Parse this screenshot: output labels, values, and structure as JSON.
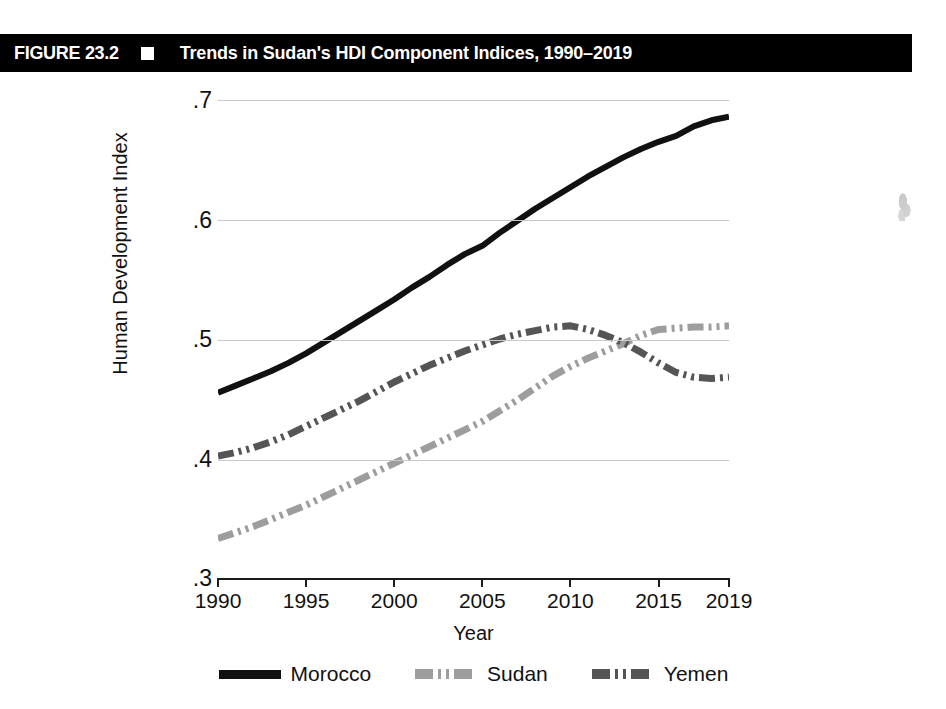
{
  "figure": {
    "number": "FIGURE 23.2",
    "marker": "black-square-bullet",
    "title": "Trends in Sudan's HDI Component Indices, 1990–2019"
  },
  "chart_data": {
    "type": "line",
    "title": "Trends in Sudan's HDI Component Indices, 1990–2019",
    "xlabel": "Year",
    "ylabel": "Human Development Index",
    "xlim": [
      1990,
      2019
    ],
    "ylim": [
      0.3,
      0.7
    ],
    "grid": true,
    "legend_position": "bottom",
    "xticks": [
      1990,
      1995,
      2000,
      2005,
      2010,
      2015,
      2019
    ],
    "xtick_labels": [
      "1990",
      "1995",
      "2000",
      "2005",
      "2010",
      "2015",
      "2019"
    ],
    "yticks": [
      0.3,
      0.4,
      0.5,
      0.6,
      0.7
    ],
    "ytick_labels": [
      ".3",
      ".4",
      ".5",
      ".6",
      ".7"
    ],
    "x": [
      1990,
      1991,
      1992,
      1993,
      1994,
      1995,
      1996,
      1997,
      1998,
      1999,
      2000,
      2001,
      2002,
      2003,
      2004,
      2005,
      2006,
      2007,
      2008,
      2009,
      2010,
      2011,
      2012,
      2013,
      2014,
      2015,
      2016,
      2017,
      2018,
      2019
    ],
    "series": [
      {
        "name": "Morocco",
        "color": "#111111",
        "style": "solid",
        "values": [
          0.455,
          0.461,
          0.467,
          0.473,
          0.48,
          0.488,
          0.497,
          0.506,
          0.515,
          0.524,
          0.533,
          0.543,
          0.552,
          0.562,
          0.571,
          0.578,
          0.589,
          0.599,
          0.609,
          0.618,
          0.627,
          0.636,
          0.644,
          0.652,
          0.659,
          0.665,
          0.67,
          0.678,
          0.683,
          0.686
        ]
      },
      {
        "name": "Sudan",
        "color": "#9d9d9d",
        "style": "dash-dot",
        "values": [
          0.333,
          0.338,
          0.343,
          0.349,
          0.355,
          0.361,
          0.368,
          0.375,
          0.382,
          0.389,
          0.396,
          0.403,
          0.41,
          0.417,
          0.424,
          0.431,
          0.44,
          0.449,
          0.459,
          0.469,
          0.477,
          0.484,
          0.49,
          0.496,
          0.503,
          0.508,
          0.509,
          0.51,
          0.51,
          0.511
        ]
      },
      {
        "name": "Yemen",
        "color": "#555555",
        "style": "dash-dot",
        "values": [
          0.402,
          0.405,
          0.409,
          0.414,
          0.42,
          0.427,
          0.434,
          0.441,
          0.448,
          0.456,
          0.464,
          0.471,
          0.478,
          0.484,
          0.49,
          0.495,
          0.5,
          0.504,
          0.507,
          0.51,
          0.511,
          0.508,
          0.503,
          0.497,
          0.489,
          0.48,
          0.472,
          0.468,
          0.467,
          0.468
        ]
      }
    ]
  },
  "legend": {
    "items": [
      {
        "label": "Morocco"
      },
      {
        "label": "Sudan"
      },
      {
        "label": "Yemen"
      }
    ]
  }
}
